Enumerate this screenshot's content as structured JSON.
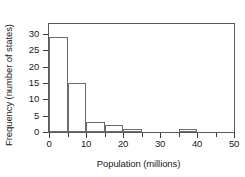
{
  "chart_data": {
    "type": "bar",
    "title": "",
    "subtitle": "",
    "xlabel": "Population (millions)",
    "ylabel": "Frequency (number of states)",
    "bin_width": 5,
    "bin_edges": [
      0,
      5,
      10,
      15,
      20,
      25,
      30,
      35,
      40,
      45,
      50
    ],
    "categories": [
      "0-5",
      "5-10",
      "10-15",
      "15-20",
      "20-25",
      "25-30",
      "30-35",
      "35-40",
      "40-45",
      "45-50"
    ],
    "values": [
      29,
      15,
      3,
      2,
      1,
      0,
      0,
      1,
      0,
      0
    ],
    "xlim": [
      0,
      50
    ],
    "ylim": [
      0,
      33
    ],
    "xticks": [
      0,
      5,
      10,
      15,
      20,
      25,
      30,
      35,
      40,
      45,
      50
    ],
    "xticklabels": [
      "0",
      "",
      "10",
      "",
      "20",
      "",
      "30",
      "",
      "40",
      "",
      "50"
    ],
    "yticks": [
      0,
      5,
      10,
      15,
      20,
      25,
      30
    ],
    "yticklabels": [
      "0",
      "5",
      "10",
      "15",
      "20",
      "25",
      "30"
    ],
    "grid": false,
    "legend": false,
    "bar_fill_color": "#ffffff",
    "bar_edge_color": "#6b6b6b",
    "frame_color": "#5a5a5a",
    "text_color": "#1a1a1a"
  }
}
